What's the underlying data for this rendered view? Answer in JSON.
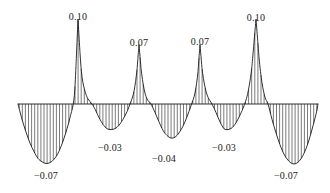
{
  "figure": {
    "background_color": "#ffffff",
    "curve_color": "#1a1a1a",
    "hatch_color": "#333333",
    "baseline_color": "#1a1a1a"
  },
  "labels": [
    {
      "text": "0.10",
      "x": 78,
      "y": 11,
      "name": "peak-label-1"
    },
    {
      "text": "0.07",
      "x": 139,
      "y": 37,
      "name": "peak-label-2"
    },
    {
      "text": "0.07",
      "x": 200,
      "y": 36,
      "name": "peak-label-3"
    },
    {
      "text": "0.10",
      "x": 256,
      "y": 12,
      "name": "peak-label-4"
    },
    {
      "text": "−0.07",
      "x": 46,
      "y": 170,
      "name": "trough-label-1"
    },
    {
      "text": "−0.03",
      "x": 110,
      "y": 142,
      "name": "trough-label-2"
    },
    {
      "text": "−0.04",
      "x": 164,
      "y": 153,
      "name": "trough-label-3"
    },
    {
      "text": "−0.03",
      "x": 224,
      "y": 142,
      "name": "trough-label-4"
    },
    {
      "text": "−0.07",
      "x": 286,
      "y": 170,
      "name": "trough-label-5"
    }
  ],
  "chart_data": {
    "type": "line",
    "title": "",
    "subtitle": "",
    "xlabel": "",
    "ylabel": "",
    "grid": false,
    "legend": null,
    "axis_visible": {
      "x_baseline": true,
      "y_axis": false,
      "ticks": false
    },
    "fill_style": "vertical-hatch",
    "baseline_value": 0,
    "ylim": [
      -0.085,
      0.115
    ],
    "xlim": [
      0,
      9
    ],
    "annotations": [
      {
        "label": "0.10",
        "x": 1.5,
        "y": 0.1
      },
      {
        "label": "0.07",
        "x": 3.6,
        "y": 0.07
      },
      {
        "label": "0.07",
        "x": 5.7,
        "y": 0.07
      },
      {
        "label": "0.10",
        "x": 7.6,
        "y": 0.1
      },
      {
        "label": "-0.07",
        "x": 0.6,
        "y": -0.07
      },
      {
        "label": "-0.03",
        "x": 2.6,
        "y": -0.03
      },
      {
        "label": "-0.04",
        "x": 4.6,
        "y": -0.04
      },
      {
        "label": "-0.03",
        "x": 6.6,
        "y": -0.03
      },
      {
        "label": "-0.07",
        "x": 8.6,
        "y": -0.07
      }
    ],
    "extrema": [
      {
        "type": "trough",
        "value": -0.07
      },
      {
        "type": "peak",
        "value": 0.1
      },
      {
        "type": "trough",
        "value": -0.03
      },
      {
        "type": "peak",
        "value": 0.07
      },
      {
        "type": "trough",
        "value": -0.04
      },
      {
        "type": "peak",
        "value": 0.07
      },
      {
        "type": "trough",
        "value": -0.03
      },
      {
        "type": "peak",
        "value": 0.1
      },
      {
        "type": "trough",
        "value": -0.07
      }
    ],
    "series": [
      {
        "name": "wavelet",
        "points": [
          [
            18,
            -0.0
          ],
          [
            22,
            -0.018
          ],
          [
            26,
            -0.033
          ],
          [
            30,
            -0.046
          ],
          [
            34,
            -0.056
          ],
          [
            38,
            -0.064
          ],
          [
            42,
            -0.068
          ],
          [
            46,
            -0.07
          ],
          [
            50,
            -0.069
          ],
          [
            54,
            -0.065
          ],
          [
            58,
            -0.058
          ],
          [
            62,
            -0.047
          ],
          [
            66,
            -0.033
          ],
          [
            70,
            -0.016
          ],
          [
            74,
            0.006
          ],
          [
            76,
            0.045
          ],
          [
            78,
            0.1
          ],
          [
            80,
            0.06
          ],
          [
            82,
            0.032
          ],
          [
            85,
            0.015
          ],
          [
            88,
            0.006
          ],
          [
            92,
            0.0
          ],
          [
            95,
            -0.006
          ],
          [
            99,
            -0.016
          ],
          [
            103,
            -0.024
          ],
          [
            107,
            -0.029
          ],
          [
            111,
            -0.03
          ],
          [
            115,
            -0.029
          ],
          [
            119,
            -0.025
          ],
          [
            123,
            -0.018
          ],
          [
            127,
            -0.009
          ],
          [
            131,
            0.003
          ],
          [
            134,
            0.015
          ],
          [
            137,
            0.04
          ],
          [
            139,
            0.07
          ],
          [
            141,
            0.042
          ],
          [
            144,
            0.018
          ],
          [
            147,
            0.006
          ],
          [
            151,
            0.0
          ],
          [
            155,
            -0.01
          ],
          [
            159,
            -0.021
          ],
          [
            163,
            -0.031
          ],
          [
            167,
            -0.037
          ],
          [
            171,
            -0.04
          ],
          [
            175,
            -0.039
          ],
          [
            179,
            -0.034
          ],
          [
            183,
            -0.026
          ],
          [
            187,
            -0.015
          ],
          [
            191,
            -0.002
          ],
          [
            195,
            0.013
          ],
          [
            198,
            0.038
          ],
          [
            200,
            0.07
          ],
          [
            202,
            0.042
          ],
          [
            205,
            0.02
          ],
          [
            208,
            0.008
          ],
          [
            212,
            0.0
          ],
          [
            216,
            -0.01
          ],
          [
            220,
            -0.021
          ],
          [
            224,
            -0.029
          ],
          [
            228,
            -0.03
          ],
          [
            232,
            -0.028
          ],
          [
            236,
            -0.022
          ],
          [
            240,
            -0.013
          ],
          [
            244,
            -0.002
          ],
          [
            248,
            0.014
          ],
          [
            252,
            0.045
          ],
          [
            256,
            0.1
          ],
          [
            259,
            0.055
          ],
          [
            262,
            0.025
          ],
          [
            265,
            0.008
          ],
          [
            268,
            0.0
          ],
          [
            272,
            -0.018
          ],
          [
            276,
            -0.034
          ],
          [
            280,
            -0.048
          ],
          [
            284,
            -0.059
          ],
          [
            288,
            -0.066
          ],
          [
            292,
            -0.07
          ],
          [
            296,
            -0.07
          ],
          [
            300,
            -0.066
          ],
          [
            304,
            -0.058
          ],
          [
            308,
            -0.046
          ],
          [
            312,
            -0.03
          ],
          [
            316,
            -0.012
          ],
          [
            318,
            0.0
          ]
        ]
      }
    ]
  },
  "geometry": {
    "baseline_y": 104,
    "x_left": 18,
    "x_right": 318,
    "px_per_unit": 850,
    "hatch_spacing": 3.1
  }
}
